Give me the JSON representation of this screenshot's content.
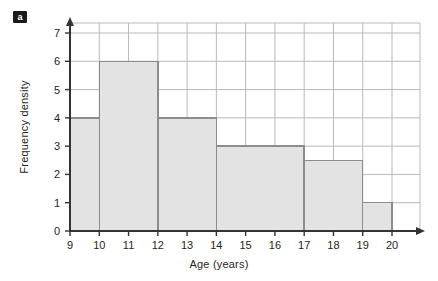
{
  "figure": {
    "part_label": "a"
  },
  "chart_data": {
    "type": "bar",
    "title": "",
    "subtitle": "",
    "xlabel": "Age (years)",
    "ylabel": "Frequency density",
    "xlim": [
      9,
      20
    ],
    "ylim": [
      0,
      7
    ],
    "grid": true,
    "legend": "none",
    "x_ticks": [
      "9",
      "10",
      "11",
      "12",
      "13",
      "14",
      "15",
      "16",
      "17",
      "18",
      "19",
      "20"
    ],
    "y_ticks": [
      "0",
      "1",
      "2",
      "3",
      "4",
      "5",
      "6",
      "7"
    ],
    "bins": [
      {
        "label": "9-10",
        "x_start": 9,
        "x_end": 10,
        "value": 4
      },
      {
        "label": "10-12",
        "x_start": 10,
        "x_end": 12,
        "value": 6
      },
      {
        "label": "12-14",
        "x_start": 12,
        "x_end": 14,
        "value": 4
      },
      {
        "label": "14-17",
        "x_start": 14,
        "x_end": 17,
        "value": 3
      },
      {
        "label": "17-19",
        "x_start": 17,
        "x_end": 19,
        "value": 2.5
      },
      {
        "label": "19-20",
        "x_start": 19,
        "x_end": 20,
        "value": 1
      }
    ],
    "categories": [
      "9-10",
      "10-12",
      "12-14",
      "14-17",
      "17-19",
      "19-20"
    ],
    "values": [
      4,
      6,
      4,
      3,
      2.5,
      1
    ]
  },
  "style": {
    "bar_fill": "#e3e3e3",
    "bar_stroke": "#8c8c8c",
    "grid_color": "#b9b9b9",
    "axis_color": "#333333",
    "background": "#ffffff"
  }
}
